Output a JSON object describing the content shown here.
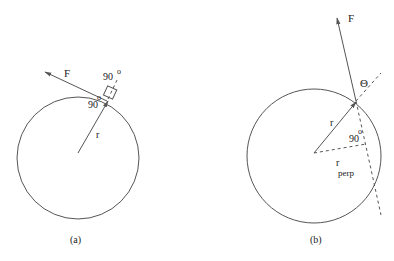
{
  "diagram_a": {
    "caption": "(a)",
    "force_label": "F",
    "radius_label": "r",
    "angle_top_label": "90",
    "angle_top_sup": "o",
    "angle_inner_label": "90",
    "angle_inner_sup": "o"
  },
  "diagram_b": {
    "caption": "(b)",
    "force_label": "F",
    "theta_label": "Θ",
    "radius_label": "r",
    "rperp_label": "r",
    "rperp_sub": "perp",
    "angle_label": "90",
    "angle_sup": "o"
  },
  "colors": {
    "stroke": "#555555",
    "text": "#222222"
  }
}
